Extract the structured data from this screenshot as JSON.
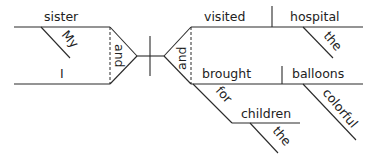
{
  "diagram": {
    "type": "sentence-diagram",
    "subjects": {
      "compound": [
        "sister",
        "I"
      ],
      "conjunction": "and",
      "modifiers": {
        "sister": "My"
      }
    },
    "predicates": {
      "compound": [
        "visited",
        "brought"
      ],
      "conjunction": "and"
    },
    "objects": {
      "visited": "hospital",
      "brought": "balloons"
    },
    "object_modifiers": {
      "hospital": "the",
      "balloons": "colorful"
    },
    "prepositional_phrase": {
      "preposition": "for",
      "object": "children",
      "object_modifier": "the"
    }
  },
  "labels": {
    "sister": "sister",
    "my": "My",
    "i": "I",
    "and_left": "and",
    "and_right": "and",
    "visited": "visited",
    "hospital": "hospital",
    "the_hospital": "the",
    "brought": "brought",
    "balloons": "balloons",
    "colorful": "colorful",
    "for": "for",
    "children": "children",
    "the_children": "the"
  }
}
